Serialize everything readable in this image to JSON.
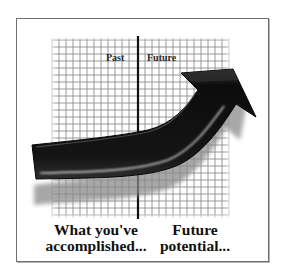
{
  "illustration": {
    "divider_labels": {
      "left": "Past",
      "right": "Future"
    },
    "captions": {
      "left_line1": "What you've",
      "left_line2": "accomplished...",
      "right_line1": "Future",
      "right_line2": "potential..."
    },
    "colors": {
      "frame": "#6e6e6e",
      "grid": "#7a7a7a",
      "arrow": "#111111",
      "arrow_shadow": "#9a9a9a",
      "text": "#111111"
    },
    "grid": {
      "left": 52,
      "top": 38,
      "right": 229,
      "bottom": 218,
      "cell": 7
    },
    "divider_x": 138
  }
}
